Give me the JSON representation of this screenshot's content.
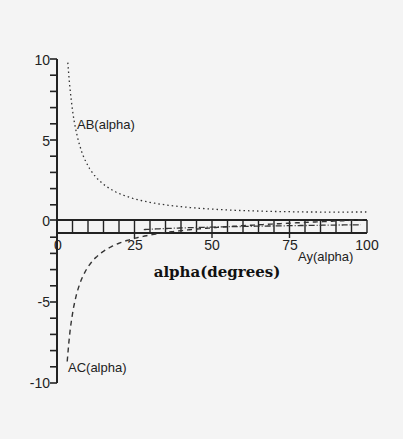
{
  "chart_data": {
    "type": "line",
    "title": "",
    "xlabel": "alpha(degrees)",
    "ylabel": "",
    "xlim": [
      0,
      100
    ],
    "ylim": [
      -10,
      10
    ],
    "x_ticks": [
      0,
      25,
      50,
      75,
      100
    ],
    "x_tick_labels": [
      "0",
      "25",
      "50",
      "75",
      "100"
    ],
    "y_ticks": [
      10,
      5,
      0,
      -5,
      -10
    ],
    "y_tick_labels": [
      "10",
      "5",
      "0",
      "-5",
      "-10"
    ],
    "grid": false,
    "legend": "inline labels",
    "series": [
      {
        "name": "AB(alpha)",
        "style": "dotted",
        "x": [
          3,
          5,
          8,
          10,
          15,
          20,
          25,
          30,
          40,
          50,
          60,
          70,
          80,
          90,
          100
        ],
        "values": [
          10.0,
          6.9,
          4.3,
          3.5,
          2.3,
          1.75,
          1.4,
          1.2,
          0.93,
          0.78,
          0.69,
          0.64,
          0.61,
          0.6,
          0.6
        ]
      },
      {
        "name": "AC(alpha)",
        "style": "dashed",
        "x": [
          3,
          5,
          8,
          10,
          15,
          20,
          25,
          30,
          40,
          50,
          60,
          70,
          80,
          90,
          100
        ],
        "values": [
          -10.0,
          -5.7,
          -3.6,
          -2.8,
          -1.9,
          -1.4,
          -1.07,
          -0.87,
          -0.6,
          -0.42,
          -0.29,
          -0.18,
          -0.09,
          0.0,
          0.09
        ]
      },
      {
        "name": "Ay(alpha)",
        "style": "dash-dot",
        "x": [
          30,
          40,
          50,
          60,
          70,
          80,
          90,
          100
        ],
        "values": [
          -0.4,
          -0.35,
          -0.3,
          -0.25,
          -0.2,
          -0.15,
          -0.12,
          -0.1
        ]
      }
    ],
    "annotations": [
      {
        "text": "AB(alpha)",
        "x": 7,
        "y": 6.2
      },
      {
        "text": "AC(alpha)",
        "x": 3.5,
        "y": -9.0
      },
      {
        "text": "Ay(alpha)",
        "x": 79,
        "y": -1.2
      }
    ]
  },
  "labels": {
    "xlabel": "alpha(degrees)",
    "ab": "AB(alpha)",
    "ac": "AC(alpha)",
    "ay": "Ay(alpha)",
    "x0": "0",
    "x25": "25",
    "x50": "50",
    "x75": "75",
    "x100": "100",
    "y10": "10",
    "y5": "5",
    "y0": "0",
    "ym5": "-5",
    "ym10": "-10"
  },
  "colors": {
    "background": "#f4f4f4",
    "ink": "#222222"
  }
}
